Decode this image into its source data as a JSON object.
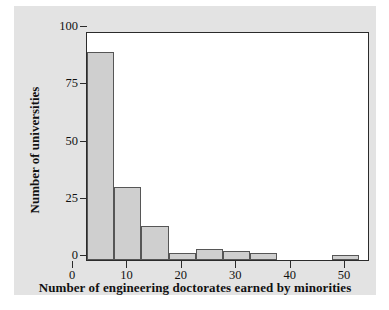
{
  "chart_data": {
    "type": "bar",
    "title": "",
    "subtitle": "",
    "xlabel": "Number of engineering doctorates earned by minorities",
    "ylabel": "Number of universities",
    "grid": false,
    "legend": null,
    "xlim": [
      0,
      52
    ],
    "ylim": [
      0,
      100
    ],
    "xticks": [
      0,
      10,
      20,
      30,
      40,
      50
    ],
    "xtick_labels": [
      "0",
      "10",
      "20",
      "30",
      "40",
      "50"
    ],
    "yticks": [
      0,
      25,
      50,
      75,
      100
    ],
    "ytick_labels": [
      "0",
      "25",
      "50",
      "75",
      "100"
    ],
    "bin_width": 5,
    "bin_edges": [
      0,
      5,
      10,
      15,
      20,
      25,
      30,
      35,
      40,
      45,
      50
    ],
    "categories": [
      "0-5",
      "5-10",
      "10-15",
      "15-20",
      "20-25",
      "25-30",
      "30-35",
      "35-40",
      "40-45",
      "45-50"
    ],
    "values": [
      91,
      32,
      15,
      3,
      5,
      4,
      3,
      0,
      0,
      2
    ],
    "bar_fill_color": "#cfcfcf",
    "bar_edge_color": "#565656",
    "axis_color": "#2b2b2b",
    "panel_color": "#e3e3e3",
    "plot_background": "#ffffff"
  }
}
